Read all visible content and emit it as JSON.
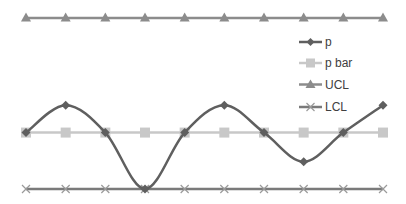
{
  "chart_data": {
    "type": "line",
    "title": "",
    "xlabel": "",
    "ylabel": "",
    "x": [
      1,
      2,
      3,
      4,
      5,
      6,
      7,
      8,
      9,
      10
    ],
    "ylim": [
      0,
      1
    ],
    "grid": false,
    "legend_position": "right-inside",
    "smooth": true,
    "series": [
      {
        "name": "p",
        "marker": "diamond",
        "color": "#5f5f5f",
        "values": [
          0.33,
          0.49,
          0.33,
          0.0,
          0.33,
          0.49,
          0.33,
          0.16,
          0.33,
          0.49
        ]
      },
      {
        "name": "p bar",
        "marker": "square",
        "color": "#c8c8c8",
        "values": [
          0.33,
          0.33,
          0.33,
          0.33,
          0.33,
          0.33,
          0.33,
          0.33,
          0.33,
          0.33
        ]
      },
      {
        "name": "UCL",
        "marker": "triangle",
        "color": "#8c8c8c",
        "values": [
          1.0,
          1.0,
          1.0,
          1.0,
          1.0,
          1.0,
          1.0,
          1.0,
          1.0,
          1.0
        ]
      },
      {
        "name": "LCL",
        "marker": "x",
        "color": "#7a7a7a",
        "values": [
          0.0,
          0.0,
          0.0,
          0.0,
          0.0,
          0.0,
          0.0,
          0.0,
          0.0,
          0.0
        ]
      }
    ]
  },
  "legend": {
    "items": [
      {
        "label": "p"
      },
      {
        "label": "p bar"
      },
      {
        "label": "UCL"
      },
      {
        "label": "LCL"
      }
    ]
  }
}
